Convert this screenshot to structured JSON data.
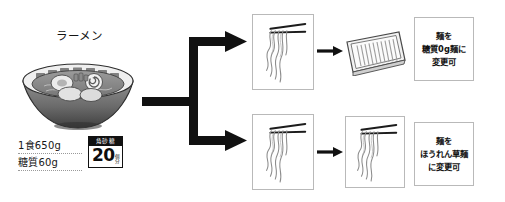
{
  "product": {
    "title": "ラーメン",
    "illustration": "ramen-bowl-icon",
    "stats": [
      {
        "key": "serving",
        "label": "1食650g"
      },
      {
        "key": "sugar",
        "label": "糖質60g"
      }
    ],
    "sugar_cube_badge": {
      "heading": "角砂糖",
      "amount": "20",
      "unit_line_1": "個",
      "unit_line_2": "分"
    }
  },
  "flow": {
    "branch_arrow": "branching-arrow-icon",
    "branches": [
      {
        "id": "top",
        "source": {
          "illustration": "chopsticks-noodles-icon"
        },
        "arrow": "arrow-right-icon",
        "result": {
          "illustration": "noodle-block-icon"
        },
        "note": {
          "line1": "麺を",
          "line2": "糖質0g麺に",
          "line3": "変更可"
        }
      },
      {
        "id": "bottom",
        "source": {
          "illustration": "chopsticks-noodles-icon"
        },
        "arrow": "arrow-right-icon",
        "result": {
          "illustration": "chopsticks-noodles-icon"
        },
        "note": {
          "line1": "麺を",
          "line2": "ほうれん草麺",
          "line3": "に変更可"
        }
      }
    ]
  },
  "colors": {
    "ink": "#111111",
    "panel_border": "#b9b9b9",
    "dotted_rule": "#9a9a9a",
    "bowl_dark": "#4c4c4c",
    "bowl_light": "#d8d8d8"
  }
}
